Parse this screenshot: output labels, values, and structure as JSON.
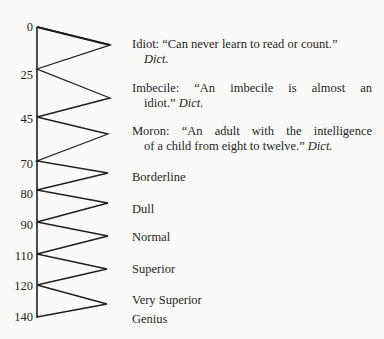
{
  "diagram": {
    "type": "zigzag-scale",
    "axis": {
      "ticks": [
        {
          "value": "0",
          "y": 27
        },
        {
          "value": "25",
          "y": 69
        },
        {
          "value": "45",
          "y": 117
        },
        {
          "value": "70",
          "y": 161
        },
        {
          "value": "80",
          "y": 190
        },
        {
          "value": "90",
          "y": 222
        },
        {
          "value": "110",
          "y": 254
        },
        {
          "value": "120",
          "y": 285
        },
        {
          "value": "140",
          "y": 317
        }
      ]
    },
    "categories": [
      {
        "name": "Idiot",
        "line1": "Idiot: “Can never learn to read or count.”",
        "line2": "Dict."
      },
      {
        "name": "Imbecile",
        "line1": "Imbecile: “An imbecile is almost an",
        "line2a": "idiot.”",
        "line2b": "Dict."
      },
      {
        "name": "Moron",
        "line1": "Moron: “An adult with the intelligence",
        "line2a": "of a child from eight to twelve.”",
        "line2b": "Dict."
      },
      {
        "name": "Borderline",
        "line1": "Borderline"
      },
      {
        "name": "Dull",
        "line1": "Dull"
      },
      {
        "name": "Normal",
        "line1": "Normal"
      },
      {
        "name": "Superior",
        "line1": "Superior"
      },
      {
        "name": "Very Superior",
        "line1": "Very Superior"
      },
      {
        "name": "Genius",
        "line1": "Genius"
      }
    ]
  }
}
